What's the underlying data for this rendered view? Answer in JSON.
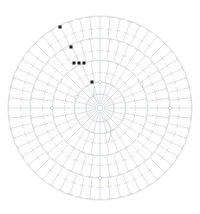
{
  "document": {
    "title": "Circular Crochet Pattern Chart",
    "kind": "crochet-stitch-diagram",
    "background_color": "#ffffff",
    "line_color": "#b9bcc4",
    "marker_color": "#1a1a1a",
    "caption": ""
  },
  "canvas": {
    "width": 200,
    "height": 214,
    "center_x": 100,
    "center_y": 108
  },
  "chart_data": {
    "type": "scatter",
    "subtitle": "Concentric rounds of double-crochet symbols radiating from a magic ring",
    "xlabel": "",
    "ylabel": "",
    "grid": false,
    "legend_position": "none",
    "coordinate_system": "polar",
    "center_ring": {
      "label": "magic-ring",
      "radius": 5,
      "inner_radius": 3,
      "spoke_count": 8,
      "spoke_length": 4
    },
    "rounds": [
      {
        "round": 1,
        "label": "Round 1",
        "inner_radius": 5,
        "outer_radius": 26,
        "stitch_count": 24,
        "stitch_symbol": "double-crochet",
        "bar_count": 1,
        "boundary_circle": true
      },
      {
        "round": 2,
        "label": "Round 2",
        "inner_radius": 26,
        "outer_radius": 48,
        "stitch_count": 32,
        "stitch_symbol": "double-crochet",
        "bar_count": 1,
        "boundary_circle": true
      },
      {
        "round": 3,
        "label": "Round 3",
        "inner_radius": 48,
        "outer_radius": 70,
        "stitch_count": 44,
        "stitch_symbol": "double-crochet",
        "bar_count": 1,
        "boundary_circle": true
      },
      {
        "round": 4,
        "label": "Round 4",
        "inner_radius": 70,
        "outer_radius": 92,
        "stitch_count": 56,
        "stitch_symbol": "double-crochet",
        "bar_count": 1,
        "boundary_circle": true
      }
    ],
    "chain_nodes": [
      {
        "label": "chain-join-left",
        "angle_deg": 180,
        "radius": 48
      },
      {
        "label": "chain-join-right",
        "angle_deg": 0,
        "radius": 70
      },
      {
        "label": "chain-join-top",
        "angle_deg": 270,
        "radius": 26
      },
      {
        "label": "chain-join-bottom",
        "angle_deg": 90,
        "radius": 70
      },
      {
        "label": "chain-join-nw",
        "angle_deg": 205,
        "radius": 26
      },
      {
        "label": "chain-join-ne",
        "angle_deg": 330,
        "radius": 48
      }
    ],
    "markers": [
      {
        "label": "marker-1",
        "x": 60,
        "y": 27,
        "size": 3
      },
      {
        "label": "marker-2",
        "x": 71,
        "y": 47,
        "size": 3
      },
      {
        "label": "marker-3",
        "x": 74,
        "y": 63,
        "size": 3
      },
      {
        "label": "marker-4",
        "x": 79,
        "y": 63,
        "size": 3
      },
      {
        "label": "marker-5",
        "x": 84,
        "y": 63,
        "size": 3
      },
      {
        "label": "marker-6",
        "x": 92,
        "y": 82,
        "size": 3
      }
    ],
    "annotations": [
      {
        "label": "start-tail",
        "type": "curve",
        "angle_deg": 250,
        "radius": 22
      },
      {
        "label": "working-yarn",
        "type": "curve",
        "angle_deg": 70,
        "radius": 35
      }
    ]
  }
}
